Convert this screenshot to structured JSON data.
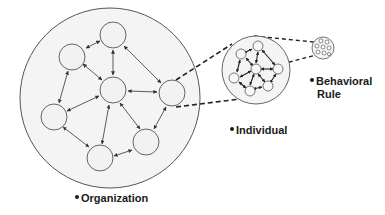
{
  "diagram": {
    "type": "nested-network-zoom",
    "colors": {
      "stroke": "#555555",
      "node_fill": "#f2f2f2",
      "circle_fill": "#f4f4f4",
      "text": "#1a1a1a"
    },
    "labels": {
      "organization": "Organization",
      "individual": "Individual",
      "behavioral_rule_line1": "Behavioral",
      "behavioral_rule_line2": "Rule"
    },
    "levels": [
      {
        "name": "Organization",
        "shape": "large circle",
        "node_count": 7
      },
      {
        "name": "Individual",
        "shape": "medium circle (zoom of one organization node)",
        "node_count": 7
      },
      {
        "name": "Behavioral Rule",
        "shape": "small circle (zoom of individual)"
      }
    ]
  }
}
